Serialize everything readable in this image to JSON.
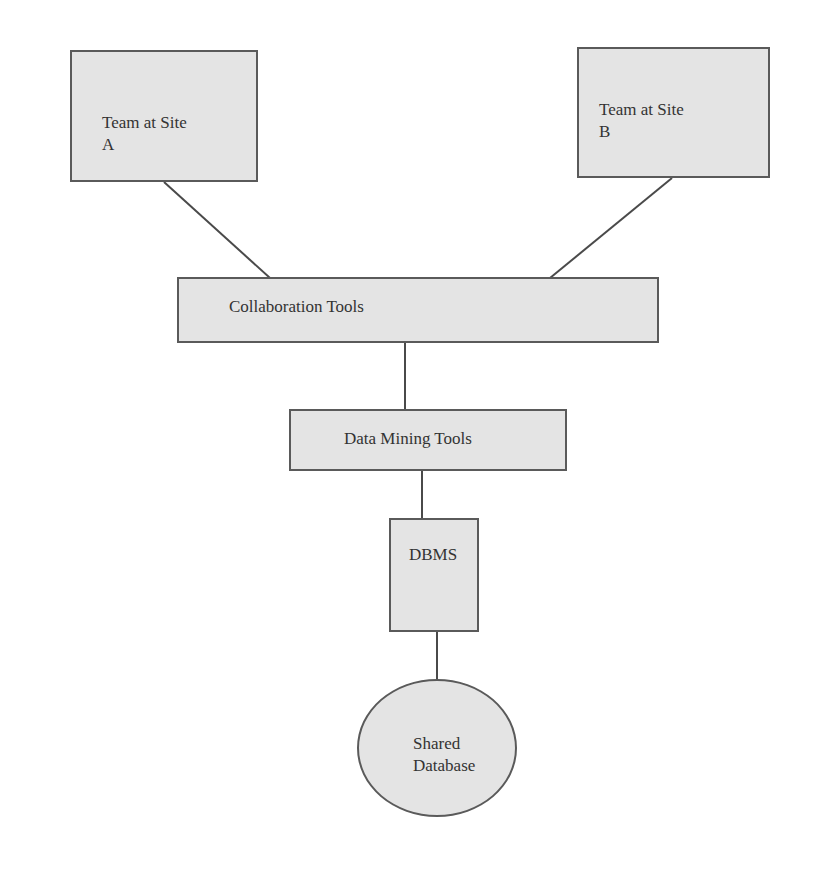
{
  "diagram": {
    "type": "block-diagram",
    "colors": {
      "fill": "#e4e4e4",
      "stroke": "#5a5a5a",
      "text": "#333333",
      "background": "#ffffff"
    },
    "nodes": [
      {
        "id": "site_a",
        "shape": "rect",
        "label_line1": "Team at Site",
        "label_line2": "A"
      },
      {
        "id": "site_b",
        "shape": "rect",
        "label_line1": "Team at Site",
        "label_line2": "B"
      },
      {
        "id": "collab",
        "shape": "rect",
        "label": "Collaboration Tools"
      },
      {
        "id": "mining",
        "shape": "rect",
        "label": "Data Mining Tools"
      },
      {
        "id": "dbms",
        "shape": "rect",
        "label": "DBMS"
      },
      {
        "id": "shared_db",
        "shape": "ellipse",
        "label_line1": "Shared",
        "label_line2": "Database"
      }
    ],
    "edges": [
      {
        "from": "site_a",
        "to": "collab"
      },
      {
        "from": "site_b",
        "to": "collab"
      },
      {
        "from": "collab",
        "to": "mining"
      },
      {
        "from": "mining",
        "to": "dbms"
      },
      {
        "from": "dbms",
        "to": "shared_db"
      }
    ]
  }
}
